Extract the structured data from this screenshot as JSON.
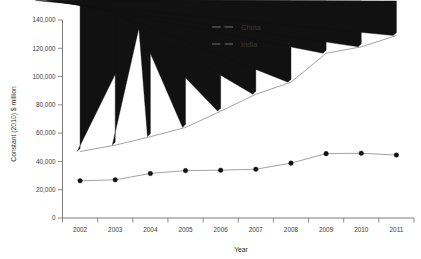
{
  "chart_data": {
    "type": "line",
    "title": "",
    "xlabel": "Year",
    "ylabel": "Constant (2010) $ million",
    "categories": [
      "2002",
      "2003",
      "2004",
      "2005",
      "2006",
      "2007",
      "2008",
      "2009",
      "2010",
      "2011"
    ],
    "x": [
      2002,
      2003,
      2004,
      2005,
      2006,
      2007,
      2008,
      2009,
      2010,
      2011
    ],
    "series": [
      {
        "name": "China",
        "marker": "triangle",
        "values": [
          47000,
          51500,
          57500,
          64000,
          75500,
          87500,
          96000,
          116500,
          121000,
          129000
        ]
      },
      {
        "name": "India",
        "marker": "circle",
        "values": [
          26300,
          27000,
          31500,
          33500,
          33800,
          34500,
          38800,
          45500,
          45800,
          44500
        ]
      }
    ],
    "ylim": [
      0,
      140000
    ],
    "yticks": [
      0,
      20000,
      40000,
      60000,
      80000,
      100000,
      120000,
      140000
    ],
    "ytick_labels": [
      "0",
      "20,000",
      "40,000",
      "60,000",
      "80,000",
      "100,000",
      "120,000",
      "140,000"
    ],
    "xtick_labels": [
      "2002",
      "2003",
      "2004",
      "2005",
      "2006",
      "2007",
      "2008",
      "2009",
      "2010",
      "2011"
    ],
    "grid": false,
    "legend_position": "top-center",
    "colors": {
      "line": "#8a8a8a",
      "marker": "#111111",
      "axis": "#6e6e6e",
      "text": "#3a3a3a",
      "background": "#ffffff"
    }
  },
  "legend": {
    "entries": [
      {
        "label": "China",
        "marker": "triangle"
      },
      {
        "label": "India",
        "marker": "circle"
      }
    ]
  },
  "axes": {
    "x_title": "Year",
    "y_title": "Constant (2010) $ million"
  }
}
